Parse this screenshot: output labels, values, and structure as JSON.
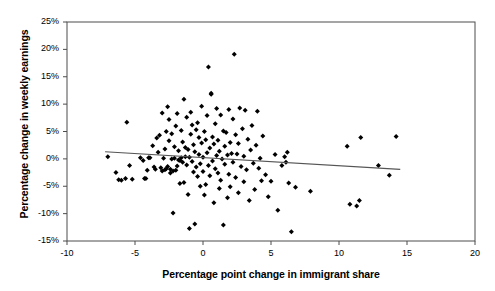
{
  "chart_data": {
    "type": "scatter",
    "title": "",
    "xlabel": "Percentage point change in immigrant share",
    "ylabel": "Percentage change in weekly earnings",
    "xlim": [
      -10,
      20
    ],
    "ylim": [
      -15,
      25
    ],
    "xticks": [
      -10,
      -5,
      0,
      5,
      10,
      15,
      20
    ],
    "xtick_labels": [
      "-10",
      "-5",
      "0",
      "5",
      "10",
      "15",
      "20"
    ],
    "yticks": [
      -15,
      -10,
      -5,
      0,
      5,
      10,
      15,
      20,
      25
    ],
    "ytick_labels": [
      "-15%",
      "-10%",
      "-5%",
      "0%",
      "5%",
      "10%",
      "15%",
      "20%",
      "25%"
    ],
    "grid": false,
    "legend": null,
    "marker": "diamond",
    "marker_color": "#000000",
    "series": [
      {
        "name": "Regions",
        "points": [
          [
            -7.0,
            0.4
          ],
          [
            -6.4,
            -2.5
          ],
          [
            -6.2,
            -3.8
          ],
          [
            -6.0,
            -3.9
          ],
          [
            -5.7,
            -3.6
          ],
          [
            -5.6,
            6.7
          ],
          [
            -5.4,
            -1.2
          ],
          [
            -5.2,
            -3.7
          ],
          [
            -4.6,
            0.2
          ],
          [
            -4.4,
            -0.3
          ],
          [
            -4.3,
            -3.6
          ],
          [
            -4.2,
            -3.6
          ],
          [
            -4.1,
            -2.1
          ],
          [
            -4.0,
            0.2
          ],
          [
            -3.9,
            0.2
          ],
          [
            -3.7,
            2.4
          ],
          [
            -3.6,
            -1.5
          ],
          [
            -3.5,
            -1.9
          ],
          [
            -3.4,
            3.8
          ],
          [
            -3.3,
            1.2
          ],
          [
            -3.2,
            4.3
          ],
          [
            -3.1,
            -1.6
          ],
          [
            -3.0,
            -2.2
          ],
          [
            -3.0,
            8.4
          ],
          [
            -2.9,
            0.1
          ],
          [
            -2.8,
            -2.0
          ],
          [
            -2.8,
            1.8
          ],
          [
            -2.7,
            5.0
          ],
          [
            -2.7,
            -1.8
          ],
          [
            -2.6,
            -1.4
          ],
          [
            -2.6,
            9.5
          ],
          [
            -2.5,
            7.2
          ],
          [
            -2.5,
            3.3
          ],
          [
            -2.4,
            -1.9
          ],
          [
            -2.4,
            -2.6
          ],
          [
            -2.3,
            0.0
          ],
          [
            -2.3,
            4.6
          ],
          [
            -2.2,
            -2.2
          ],
          [
            -2.2,
            -9.9
          ],
          [
            -2.1,
            0.1
          ],
          [
            -2.1,
            2.2
          ],
          [
            -2.0,
            -2.1
          ],
          [
            -2.0,
            6.0
          ],
          [
            -1.9,
            -1.3
          ],
          [
            -1.9,
            8.3
          ],
          [
            -1.8,
            -0.2
          ],
          [
            -1.8,
            1.5
          ],
          [
            -1.7,
            -0.3
          ],
          [
            -1.7,
            -4.5
          ],
          [
            -1.6,
            0.2
          ],
          [
            -1.6,
            5.2
          ],
          [
            -1.5,
            -0.6
          ],
          [
            -1.5,
            3.1
          ],
          [
            -1.4,
            10.9
          ],
          [
            -1.4,
            -4.3
          ],
          [
            -1.3,
            0.4
          ],
          [
            -1.3,
            2.1
          ],
          [
            -1.2,
            -1.1
          ],
          [
            -1.2,
            7.6
          ],
          [
            -1.1,
            -6.5
          ],
          [
            -1.1,
            1.7
          ],
          [
            -1.0,
            0.3
          ],
          [
            -1.0,
            -12.7
          ],
          [
            -0.9,
            8.5
          ],
          [
            -0.9,
            4.5
          ],
          [
            -0.8,
            -0.5
          ],
          [
            -0.8,
            6.2
          ],
          [
            -0.7,
            -2.4
          ],
          [
            -0.7,
            2.6
          ],
          [
            -0.6,
            -11.9
          ],
          [
            -0.6,
            1.3
          ],
          [
            -0.5,
            5.3
          ],
          [
            -0.5,
            -1.5
          ],
          [
            -0.4,
            6.6
          ],
          [
            -0.4,
            -3.2
          ],
          [
            -0.3,
            0.8
          ],
          [
            -0.3,
            3.9
          ],
          [
            -0.2,
            -0.9
          ],
          [
            -0.2,
            -5.0
          ],
          [
            -0.1,
            2.9
          ],
          [
            -0.1,
            9.6
          ],
          [
            0.0,
            0.3
          ],
          [
            0.0,
            -2.3
          ],
          [
            0.1,
            5.0
          ],
          [
            0.1,
            -6.6
          ],
          [
            0.2,
            3.5
          ],
          [
            0.2,
            -4.7
          ],
          [
            0.3,
            1.1
          ],
          [
            0.3,
            7.9
          ],
          [
            0.4,
            -1.2
          ],
          [
            0.4,
            16.8
          ],
          [
            0.5,
            2.0
          ],
          [
            0.5,
            -3.1
          ],
          [
            0.6,
            12.0
          ],
          [
            0.6,
            11.8
          ],
          [
            0.7,
            -0.4
          ],
          [
            0.7,
            4.0
          ],
          [
            0.8,
            -8.0
          ],
          [
            0.8,
            2.7
          ],
          [
            0.9,
            6.4
          ],
          [
            0.9,
            -1.8
          ],
          [
            1.0,
            0.6
          ],
          [
            1.0,
            9.2
          ],
          [
            1.1,
            -2.6
          ],
          [
            1.1,
            3.4
          ],
          [
            1.2,
            -5.4
          ],
          [
            1.2,
            1.4
          ],
          [
            1.3,
            8.0
          ],
          [
            1.3,
            -3.9
          ],
          [
            1.4,
            0.0
          ],
          [
            1.5,
            5.1
          ],
          [
            1.5,
            -12.1
          ],
          [
            1.6,
            2.3
          ],
          [
            1.6,
            -1.0
          ],
          [
            1.7,
            4.8
          ],
          [
            1.8,
            -7.1
          ],
          [
            1.8,
            0.7
          ],
          [
            1.9,
            9.0
          ],
          [
            1.9,
            -2.8
          ],
          [
            2.0,
            3.0
          ],
          [
            2.0,
            -5.1
          ],
          [
            2.1,
            1.0
          ],
          [
            2.2,
            7.3
          ],
          [
            2.2,
            -0.6
          ],
          [
            2.3,
            19.1
          ],
          [
            2.4,
            4.4
          ],
          [
            2.4,
            -3.4
          ],
          [
            2.5,
            0.9
          ],
          [
            2.6,
            -6.2
          ],
          [
            2.6,
            2.8
          ],
          [
            2.7,
            9.3
          ],
          [
            2.8,
            -1.4
          ],
          [
            2.9,
            5.5
          ],
          [
            3.0,
            -4.2
          ],
          [
            3.0,
            0.5
          ],
          [
            3.1,
            8.9
          ],
          [
            3.2,
            -2.0
          ],
          [
            3.3,
            3.6
          ],
          [
            3.4,
            -7.6
          ],
          [
            3.5,
            1.6
          ],
          [
            3.6,
            6.1
          ],
          [
            3.7,
            -0.8
          ],
          [
            3.8,
            -5.6
          ],
          [
            3.9,
            2.5
          ],
          [
            4.0,
            8.7
          ],
          [
            4.1,
            -1.7
          ],
          [
            4.2,
            0.1
          ],
          [
            4.3,
            -4.0
          ],
          [
            4.4,
            4.2
          ],
          [
            4.6,
            -2.9
          ],
          [
            4.8,
            -6.9
          ],
          [
            5.0,
            -4.1
          ],
          [
            5.3,
            0.8
          ],
          [
            5.5,
            -9.4
          ],
          [
            5.8,
            -1.2
          ],
          [
            6.0,
            0.4
          ],
          [
            6.1,
            -0.6
          ],
          [
            6.2,
            1.2
          ],
          [
            6.3,
            -4.4
          ],
          [
            6.5,
            -13.3
          ],
          [
            6.8,
            -5.2
          ],
          [
            7.9,
            -5.9
          ],
          [
            10.6,
            2.3
          ],
          [
            10.8,
            -8.3
          ],
          [
            11.3,
            -8.6
          ],
          [
            11.5,
            -7.6
          ],
          [
            11.6,
            3.9
          ],
          [
            12.9,
            -1.2
          ],
          [
            13.7,
            -3.0
          ],
          [
            14.2,
            4.1
          ]
        ]
      }
    ],
    "trendline": {
      "x_start": -7.2,
      "y_start": 1.3,
      "x_end": 14.5,
      "y_end": -1.9,
      "color": "#555555"
    }
  }
}
